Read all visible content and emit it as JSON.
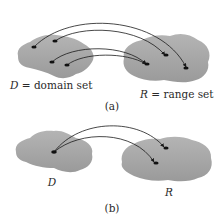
{
  "figure": {
    "colors": {
      "blob_fill": "#a9a9a9",
      "blob_shade": "#959595",
      "point": "#111111",
      "arrow": "#1a1a1a",
      "text": "#2a2a2a"
    },
    "panel_a": {
      "domain_label_var": "D",
      "domain_label_rest": " = domain set",
      "range_label_var": "R",
      "range_label_rest": " = range set",
      "caption": "(a)",
      "domain_points": 4,
      "range_points": 3
    },
    "panel_b": {
      "domain_label": "D",
      "range_label": "R",
      "caption": "(b)",
      "domain_points": 1,
      "range_points": 2
    }
  }
}
